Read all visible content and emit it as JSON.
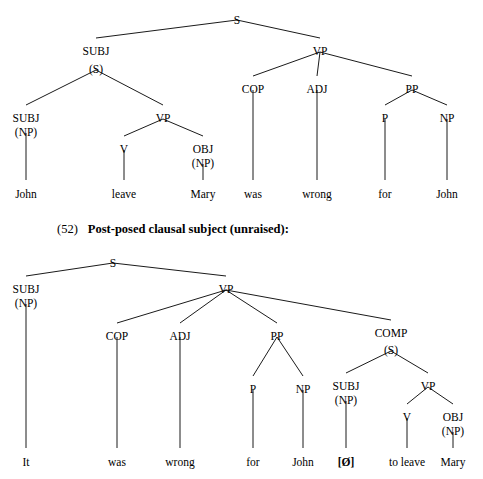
{
  "figure": {
    "caption": {
      "number": "(52)",
      "title": "Post-posed clausal subject (unraised):"
    },
    "trees": [
      {
        "id": "tree-51",
        "nodes": [
          {
            "id": "n1",
            "label": "S",
            "x": 237,
            "y": 14
          },
          {
            "id": "n2",
            "label": "SUBJ",
            "x": 96,
            "y": 45
          },
          {
            "id": "n3",
            "label": "VP",
            "x": 320,
            "y": 45
          },
          {
            "id": "n4",
            "label": "(S)",
            "x": 96,
            "y": 63
          },
          {
            "id": "n5",
            "label": "COP",
            "x": 253,
            "y": 83
          },
          {
            "id": "n6",
            "label": "ADJ",
            "x": 317,
            "y": 83
          },
          {
            "id": "n7",
            "label": "PP",
            "x": 412,
            "y": 83
          },
          {
            "id": "n8",
            "label": "SUBJ",
            "x": 26,
            "y": 112
          },
          {
            "id": "n9",
            "label": "(NP)",
            "x": 26,
            "y": 126
          },
          {
            "id": "n10",
            "label": "VP",
            "x": 163,
            "y": 112
          },
          {
            "id": "n11",
            "label": "P",
            "x": 385,
            "y": 112
          },
          {
            "id": "n12",
            "label": "NP",
            "x": 447,
            "y": 112
          },
          {
            "id": "n13",
            "label": "V",
            "x": 124,
            "y": 143
          },
          {
            "id": "n14",
            "label": "OBJ",
            "x": 203,
            "y": 143
          },
          {
            "id": "n15",
            "label": "(NP)",
            "x": 203,
            "y": 157
          },
          {
            "id": "n16",
            "label": "John",
            "x": 26,
            "y": 188
          },
          {
            "id": "n17",
            "label": "leave",
            "x": 124,
            "y": 188
          },
          {
            "id": "n18",
            "label": "Mary",
            "x": 203,
            "y": 188
          },
          {
            "id": "n19",
            "label": "was",
            "x": 253,
            "y": 188
          },
          {
            "id": "n20",
            "label": "wrong",
            "x": 317,
            "y": 188
          },
          {
            "id": "n21",
            "label": "for",
            "x": 385,
            "y": 188
          },
          {
            "id": "n22",
            "label": "John",
            "x": 447,
            "y": 188
          }
        ],
        "edges": [
          [
            237,
            20,
            96,
            38
          ],
          [
            237,
            20,
            320,
            38
          ],
          [
            96,
            70,
            26,
            105
          ],
          [
            96,
            70,
            163,
            105
          ],
          [
            320,
            52,
            253,
            76
          ],
          [
            320,
            52,
            317,
            76
          ],
          [
            320,
            52,
            412,
            76
          ],
          [
            26,
            133,
            26,
            180
          ],
          [
            163,
            119,
            124,
            136
          ],
          [
            163,
            119,
            203,
            136
          ],
          [
            412,
            90,
            385,
            105
          ],
          [
            412,
            90,
            447,
            105
          ],
          [
            124,
            150,
            124,
            180
          ],
          [
            203,
            164,
            203,
            180
          ],
          [
            253,
            90,
            253,
            180
          ],
          [
            317,
            90,
            317,
            180
          ],
          [
            385,
            119,
            385,
            180
          ],
          [
            447,
            119,
            447,
            180
          ]
        ]
      },
      {
        "id": "tree-52",
        "nodes": [
          {
            "id": "m1",
            "label": "S",
            "x": 113,
            "y": 257
          },
          {
            "id": "m2",
            "label": "SUBJ",
            "x": 26,
            "y": 283
          },
          {
            "id": "m3",
            "label": "(NP)",
            "x": 26,
            "y": 297
          },
          {
            "id": "m4",
            "label": "VP",
            "x": 226,
            "y": 283
          },
          {
            "id": "m5",
            "label": "COP",
            "x": 117,
            "y": 330
          },
          {
            "id": "m6",
            "label": "ADJ",
            "x": 180,
            "y": 330
          },
          {
            "id": "m7",
            "label": "PP",
            "x": 277,
            "y": 330
          },
          {
            "id": "m8",
            "label": "COMP",
            "x": 391,
            "y": 327
          },
          {
            "id": "m9",
            "label": "(S)",
            "x": 391,
            "y": 344
          },
          {
            "id": "m10",
            "label": "P",
            "x": 253,
            "y": 383
          },
          {
            "id": "m11",
            "label": "NP",
            "x": 303,
            "y": 383
          },
          {
            "id": "m12",
            "label": "SUBJ",
            "x": 346,
            "y": 380
          },
          {
            "id": "m13",
            "label": "(NP)",
            "x": 346,
            "y": 394
          },
          {
            "id": "m14",
            "label": "VP",
            "x": 428,
            "y": 380
          },
          {
            "id": "m15",
            "label": "V",
            "x": 407,
            "y": 411
          },
          {
            "id": "m16",
            "label": "OBJ",
            "x": 453,
            "y": 411
          },
          {
            "id": "m17",
            "label": "(NP)",
            "x": 453,
            "y": 425
          },
          {
            "id": "m18",
            "label": "It",
            "x": 26,
            "y": 456
          },
          {
            "id": "m19",
            "label": "was",
            "x": 117,
            "y": 456
          },
          {
            "id": "m20",
            "label": "wrong",
            "x": 180,
            "y": 456
          },
          {
            "id": "m21",
            "label": "for",
            "x": 253,
            "y": 456
          },
          {
            "id": "m22",
            "label": "John",
            "x": 303,
            "y": 456
          },
          {
            "id": "m23",
            "label": "[Ø]",
            "x": 346,
            "y": 456,
            "bold": true
          },
          {
            "id": "m24",
            "label": "to leave",
            "x": 407,
            "y": 456
          },
          {
            "id": "m25",
            "label": "Mary",
            "x": 453,
            "y": 456
          }
        ],
        "edges": [
          [
            113,
            263,
            26,
            276
          ],
          [
            113,
            263,
            226,
            276
          ],
          [
            26,
            304,
            26,
            448
          ],
          [
            226,
            290,
            117,
            323
          ],
          [
            226,
            290,
            180,
            323
          ],
          [
            226,
            290,
            277,
            323
          ],
          [
            226,
            290,
            391,
            320
          ],
          [
            117,
            337,
            117,
            448
          ],
          [
            180,
            337,
            180,
            448
          ],
          [
            277,
            337,
            253,
            376
          ],
          [
            277,
            337,
            303,
            376
          ],
          [
            391,
            351,
            346,
            373
          ],
          [
            391,
            351,
            428,
            373
          ],
          [
            253,
            390,
            253,
            448
          ],
          [
            303,
            390,
            303,
            448
          ],
          [
            346,
            401,
            346,
            448
          ],
          [
            428,
            387,
            407,
            404
          ],
          [
            428,
            387,
            453,
            404
          ],
          [
            407,
            418,
            407,
            448
          ],
          [
            453,
            432,
            453,
            448
          ]
        ]
      }
    ]
  }
}
